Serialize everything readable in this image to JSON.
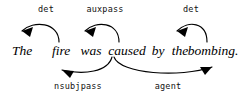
{
  "diagram": {
    "type": "dependency-parse",
    "sentence_text": "The fire was caused by the bombing.",
    "ink_color": "#000000",
    "background_color": "#ffffff",
    "words": [
      {
        "id": "w1",
        "text": "The",
        "x": 22
      },
      {
        "id": "w2",
        "text": "fire",
        "x": 61
      },
      {
        "id": "w3",
        "text": "was",
        "x": 91
      },
      {
        "id": "w4",
        "text": "caused",
        "x": 127
      },
      {
        "id": "w5",
        "text": "by",
        "x": 158
      },
      {
        "id": "w6",
        "text": "the",
        "x": 180
      },
      {
        "id": "w7",
        "text": "bombing.",
        "x": 213
      }
    ],
    "arcs_above": [
      {
        "id": "arc-det-the",
        "label": "det",
        "relation": "det",
        "head": "fire",
        "dependent": "The",
        "label_x": 46,
        "label_y": 12,
        "path": "M 59 42 C 59 22 33 20 22 31",
        "arrow_points": "22,31 33,27 30,37"
      },
      {
        "id": "arc-auxpass-was",
        "label": "auxpass",
        "relation": "auxpass",
        "head": "caused",
        "dependent": "was",
        "label_x": 105,
        "label_y": 12,
        "path": "M 119 42 C 119 22 96 20 85 31",
        "arrow_points": "85,31 96,27 93,37"
      },
      {
        "id": "arc-det-the2",
        "label": "det",
        "relation": "det",
        "head": "bombing.",
        "dependent": "the",
        "label_x": 191,
        "label_y": 12,
        "path": "M 207 42 C 207 22 188 20 177 31",
        "arrow_points": "177,31 188,27 185,37"
      }
    ],
    "arcs_below": [
      {
        "id": "arc-nsubjpass-fire",
        "label": "nsubjpass",
        "relation": "nsubjpass",
        "head": "caused",
        "dependent": "fire",
        "label_x": 78,
        "label_y": 89,
        "path": "M 112 57 C 108 72 84 75 62 70",
        "arrow_points": "62,70 74,71 70,78"
      },
      {
        "id": "arc-agent-bombing",
        "label": "agent",
        "relation": "agent",
        "head": "caused",
        "dependent": "bombing.",
        "label_x": 168,
        "label_y": 89,
        "path": "M 114 57 C 120 74 180 78 212 67",
        "arrow_points": "212,67 200,67 205,75"
      }
    ],
    "baseline_y": 55
  }
}
